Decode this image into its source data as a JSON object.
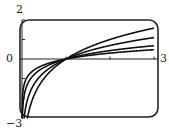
{
  "chart_data": {
    "type": "line",
    "title": "",
    "xlabel": "",
    "ylabel": "",
    "xlim": [
      0,
      3
    ],
    "ylim": [
      -3,
      2
    ],
    "grid": false,
    "legend": null,
    "tick_labels": {
      "y_max": "2",
      "y_zero": "0",
      "x_max": "3",
      "y_min": "-3"
    },
    "x_ticks": [
      1,
      2,
      3
    ],
    "y_ticks": [
      -2,
      -1,
      0,
      1,
      2
    ],
    "series": [
      {
        "name": "y = log2 x",
        "base": 2,
        "x": [
          0.02,
          0.1,
          0.25,
          0.5,
          1,
          1.5,
          2,
          2.5,
          3
        ],
        "values": [
          -5.64,
          -3.32,
          -2.0,
          -1.0,
          0,
          0.585,
          1.0,
          1.32,
          1.585
        ]
      },
      {
        "name": "y = ln x",
        "base": 2.718,
        "x": [
          0.02,
          0.1,
          0.25,
          0.5,
          1,
          1.5,
          2,
          2.5,
          3
        ],
        "values": [
          -3.91,
          -2.3,
          -1.39,
          -0.69,
          0,
          0.405,
          0.693,
          0.916,
          1.099
        ]
      },
      {
        "name": "y = log5 x",
        "base": 5,
        "x": [
          0.02,
          0.1,
          0.25,
          0.5,
          1,
          1.5,
          2,
          2.5,
          3
        ],
        "values": [
          -2.43,
          -1.43,
          -0.86,
          -0.43,
          0,
          0.252,
          0.431,
          0.569,
          0.683
        ]
      },
      {
        "name": "y = log10 x",
        "base": 10,
        "x": [
          0.02,
          0.1,
          0.25,
          0.5,
          1,
          1.5,
          2,
          2.5,
          3
        ],
        "values": [
          -1.7,
          -1.0,
          -0.6,
          -0.3,
          0,
          0.176,
          0.301,
          0.398,
          0.477
        ]
      }
    ],
    "annotations": [
      "All curves pass through (1, 0)"
    ]
  },
  "style": {
    "line_color": "#111111",
    "frame_color": "#222222",
    "background": "#ffffff"
  }
}
